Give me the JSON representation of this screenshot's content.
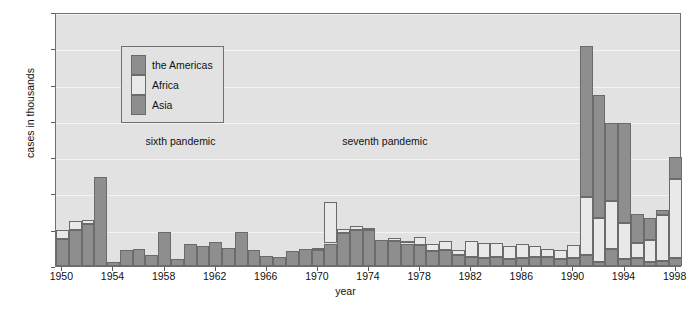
{
  "chart_data": {
    "type": "bar",
    "subtype": "stacked-bar",
    "title": "",
    "xlabel": "year",
    "ylabel": "cases in thousands",
    "ylim": [
      0,
      700
    ],
    "ytick_values": [
      0,
      100,
      200,
      300,
      400,
      500,
      600,
      700
    ],
    "ytick_labels": [
      "0",
      "100",
      "200",
      "300",
      "400",
      "500",
      "600",
      "700"
    ],
    "xlim": [
      1950,
      1999
    ],
    "xtick_values": [
      1950,
      1954,
      1958,
      1962,
      1966,
      1970,
      1974,
      1978,
      1982,
      1986,
      1990,
      1994,
      1998
    ],
    "xtick_labels": [
      "1950",
      "1954",
      "1958",
      "1962",
      "1966",
      "1970",
      "1974",
      "1978",
      "1982",
      "1986",
      "1990",
      "1994",
      "1998"
    ],
    "grid": true,
    "grid_axis": "y",
    "legend_position": "upper-left",
    "categories": [
      1950,
      1951,
      1952,
      1953,
      1954,
      1955,
      1956,
      1957,
      1958,
      1959,
      1960,
      1961,
      1962,
      1963,
      1964,
      1965,
      1966,
      1967,
      1968,
      1969,
      1970,
      1971,
      1972,
      1973,
      1974,
      1975,
      1976,
      1977,
      1978,
      1979,
      1980,
      1981,
      1982,
      1983,
      1984,
      1985,
      1986,
      1987,
      1988,
      1989,
      1990,
      1991,
      1992,
      1993,
      1994,
      1995,
      1996,
      1997,
      1998
    ],
    "series": [
      {
        "name": "Asia",
        "color": "#8e8e8e",
        "values": [
          75,
          100,
          115,
          245,
          10,
          45,
          48,
          30,
          95,
          20,
          60,
          55,
          65,
          50,
          95,
          45,
          28,
          25,
          40,
          48,
          45,
          62,
          92,
          100,
          100,
          72,
          68,
          62,
          58,
          40,
          45,
          30,
          25,
          22,
          25,
          20,
          22,
          25,
          25,
          20,
          22,
          30,
          12,
          48,
          18,
          22,
          10,
          15,
          22
        ]
      },
      {
        "name": "Africa",
        "color": "#e9e9e9",
        "values": [
          25,
          25,
          12,
          0,
          0,
          0,
          0,
          0,
          0,
          0,
          0,
          0,
          0,
          0,
          0,
          0,
          0,
          0,
          0,
          0,
          5,
          115,
          10,
          10,
          5,
          0,
          8,
          8,
          22,
          20,
          25,
          15,
          45,
          42,
          38,
          35,
          38,
          30,
          22,
          24,
          35,
          160,
          120,
          130,
          100,
          42,
          62,
          125,
          218
        ]
      },
      {
        "name": "the Americas",
        "color": "#8e8e8e",
        "values": [
          0,
          0,
          0,
          0,
          0,
          0,
          0,
          0,
          0,
          0,
          0,
          0,
          0,
          0,
          0,
          0,
          0,
          0,
          0,
          0,
          0,
          0,
          0,
          0,
          0,
          0,
          0,
          0,
          0,
          0,
          0,
          0,
          0,
          0,
          0,
          0,
          0,
          0,
          0,
          0,
          0,
          415,
          340,
          215,
          275,
          80,
          60,
          15,
          60
        ]
      }
    ],
    "totals": [
      100,
      125,
      127,
      245,
      10,
      45,
      48,
      30,
      95,
      20,
      60,
      55,
      65,
      50,
      95,
      45,
      28,
      25,
      40,
      48,
      50,
      177,
      102,
      110,
      105,
      72,
      76,
      70,
      80,
      60,
      70,
      45,
      70,
      64,
      63,
      55,
      60,
      55,
      47,
      44,
      57,
      605,
      472,
      393,
      393,
      144,
      132,
      155,
      300
    ],
    "annotations": [
      {
        "text": "sixth pandemic",
        "x_year": 1957.0,
        "y_value": 348
      },
      {
        "text": "seventh pandemic",
        "x_year": 1972.4,
        "y_value": 348
      }
    ]
  },
  "legend": {
    "items": [
      {
        "label": "the Americas",
        "color": "#8e8e8e"
      },
      {
        "label": "Africa",
        "color": "#e9e9e9"
      },
      {
        "label": "Asia",
        "color": "#8e8e8e"
      }
    ]
  },
  "colors": {
    "plot_background": "#e2e2e2",
    "page_background": "#ffffff",
    "gridline": "#f4f4f4",
    "frame": "#6f6f6f",
    "bar_outline": "#6b6b6b",
    "text": "#111111"
  }
}
